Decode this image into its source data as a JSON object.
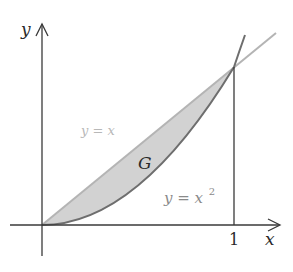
{
  "figure": {
    "axes": {
      "x_label": "x",
      "y_label": "y",
      "x_tick_label": "1"
    },
    "curves": [
      {
        "name": "line",
        "equation_lhs": "y = x",
        "color": "#b4b4b4"
      },
      {
        "name": "parabola",
        "equation_lhs": "y = x",
        "exponent": "2",
        "color": "#7a7a7a"
      }
    ],
    "region": {
      "label": "G",
      "fill": "#d2d2d2",
      "description": "region between y = x and y = x^2 for 0 ≤ x ≤ 1"
    },
    "colors": {
      "axis": "#3a3a3a",
      "line_y_eq_x": "#b4b4b4",
      "parabola": "#6e6e6e",
      "region_fill": "#d2d2d2",
      "text_dark": "#2a2a2a",
      "text_light": "#b0b0b0",
      "text_mid": "#8a8a8a"
    }
  }
}
